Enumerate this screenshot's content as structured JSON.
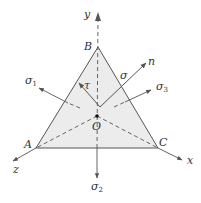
{
  "diagram": {
    "type": "stress-octahedral-plane",
    "colors": {
      "face_fill": "#ececec",
      "edge": "#555555",
      "arrow": "#555555",
      "text": "#333333"
    },
    "vertices": {
      "A": {
        "label": "A"
      },
      "B": {
        "label": "B"
      },
      "C": {
        "label": "C"
      },
      "O": {
        "label": "O"
      }
    },
    "axes": {
      "x": {
        "label": "x"
      },
      "y": {
        "label": "y"
      },
      "z": {
        "label": "z"
      }
    },
    "vectors": {
      "n": {
        "label": "n"
      },
      "sigma": {
        "label": "σ"
      },
      "tau": {
        "label": "τ"
      },
      "sigma1": {
        "label": "σ",
        "sub": "1"
      },
      "sigma2": {
        "label": "σ",
        "sub": "2"
      },
      "sigma3": {
        "label": "σ",
        "sub": "3"
      }
    }
  }
}
